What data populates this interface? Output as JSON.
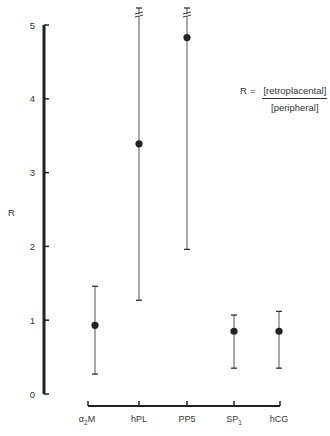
{
  "chart_data": {
    "type": "scatter",
    "subtype": "error-bar (mean with range)",
    "title": "",
    "xlabel": "",
    "ylabel": "R",
    "ylim": [
      0,
      5
    ],
    "yticks": [
      0,
      1,
      2,
      3,
      4,
      5
    ],
    "grid": false,
    "legend": null,
    "categories": [
      "α2M",
      "hPL",
      "PP5",
      "SP1",
      "hCG"
    ],
    "category_labels": [
      {
        "base": "α",
        "sub": "2",
        "suffix": "M"
      },
      {
        "base": "hPL",
        "sub": "",
        "suffix": ""
      },
      {
        "base": "PP5",
        "sub": "",
        "suffix": ""
      },
      {
        "base": "SP",
        "sub": "1",
        "suffix": ""
      },
      {
        "base": "hCG",
        "sub": "",
        "suffix": ""
      }
    ],
    "series": [
      {
        "name": "R",
        "values": [
          0.93,
          3.39,
          4.83,
          0.85,
          0.85
        ],
        "lower": [
          0.27,
          1.27,
          1.96,
          0.35,
          0.35
        ],
        "upper": [
          1.46,
          5.2,
          5.2,
          1.07,
          1.12
        ],
        "upper_truncated": [
          false,
          true,
          true,
          false,
          false
        ]
      }
    ],
    "annotations": [
      {
        "text": "R = [retroplacental] / [peripheral]",
        "position": "upper right"
      }
    ]
  },
  "formula": {
    "lhs": "R",
    "equals": "=",
    "numerator": "[retroplacental]",
    "denominator": "[peripheral]"
  },
  "axis": {
    "y_label": "R",
    "y_ticks": [
      "0",
      "1",
      "2",
      "3",
      "4",
      "5"
    ]
  },
  "colors": {
    "ink": "#222222",
    "errorbar": "#555555",
    "background": "#ffffff"
  }
}
